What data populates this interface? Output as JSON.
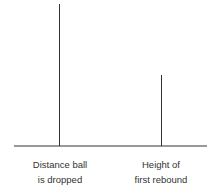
{
  "diagram": {
    "bars": [
      {
        "label_line1": "Distance ball",
        "label_line2": "is dropped",
        "relative_height": 1.0
      },
      {
        "label_line1": "Height of",
        "label_line2": "first rebound",
        "relative_height": 0.5
      }
    ],
    "line_color": "#333333"
  }
}
